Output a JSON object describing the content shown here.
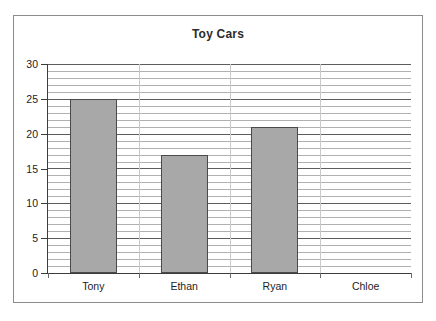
{
  "chart_data": {
    "type": "bar",
    "title": "Toy Cars",
    "xlabel": "",
    "ylabel": "",
    "categories": [
      "Tony",
      "Ethan",
      "Ryan",
      "Chloe"
    ],
    "values": [
      25,
      17,
      21,
      0
    ],
    "ylim": [
      0,
      30
    ],
    "ytick_labels": [
      "30",
      "25",
      "20",
      "15",
      "10",
      "5",
      "0"
    ],
    "ytick_values": [
      30,
      25,
      20,
      15,
      10,
      5,
      0
    ],
    "ytick_step": 5,
    "minor_gridline_step": 1,
    "grid": true,
    "legend": false,
    "bar_fill_color": "#a8a8a8",
    "bar_border_color": "#4a4a4a",
    "gridline_color": "#9a9a9a",
    "axis_color": "#3c3c3c",
    "frame_color": "#8c8c8c",
    "background_color": "#ffffff"
  }
}
